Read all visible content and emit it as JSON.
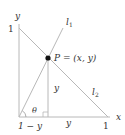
{
  "diagram": {
    "axes": {
      "x_label": "x",
      "y_label": "y",
      "y_tick_label": "1",
      "x_tick_label": "1"
    },
    "point": {
      "label": "P = (x, y)"
    },
    "lines": {
      "l1_label": "l",
      "l1_sub": "1",
      "l2_label": "l",
      "l2_sub": "2"
    },
    "segments": {
      "vertical_label": "y",
      "bottom_left_label": "1 − y",
      "bottom_right_label": "y"
    },
    "angle": {
      "label": "θ"
    },
    "colors": {
      "line": "#b8b8b8",
      "text": "#333333",
      "point": "#111111"
    }
  }
}
